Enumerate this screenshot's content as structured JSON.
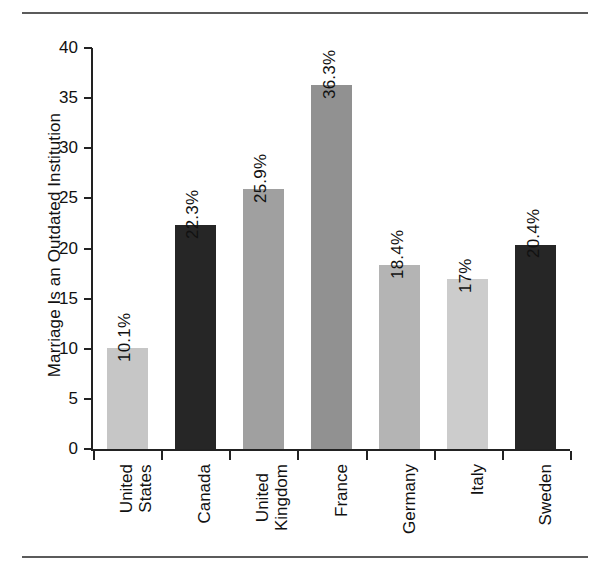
{
  "figure": {
    "y_axis_title": "Marriage Is an Outdated Institution",
    "rules": {
      "top": "horizontal-rule",
      "bottom": "horizontal-rule"
    }
  },
  "chart_data": {
    "type": "bar",
    "title": "",
    "xlabel": "",
    "ylabel": "Marriage Is an Outdated Institution",
    "ylim": [
      0,
      40
    ],
    "yticks": [
      0,
      5,
      10,
      15,
      20,
      25,
      30,
      35,
      40
    ],
    "ytick_labels": [
      "0",
      "5",
      "10",
      "15",
      "20",
      "25",
      "30",
      "35",
      "40"
    ],
    "grid": false,
    "legend": "none",
    "categories": [
      "United States",
      "Canada",
      "United Kingdom",
      "France",
      "Germany",
      "Italy",
      "Sweden"
    ],
    "category_lines": [
      [
        "United",
        "States"
      ],
      [
        "Canada"
      ],
      [
        "United",
        "Kingdom"
      ],
      [
        "France"
      ],
      [
        "Germany"
      ],
      [
        "Italy"
      ],
      [
        "Sweden"
      ]
    ],
    "values": [
      10.1,
      22.3,
      25.9,
      36.3,
      18.4,
      17,
      20.4
    ],
    "data_labels": [
      "10.1%",
      "22.3%",
      "25.9%",
      "36.3%",
      "18.4%",
      "17%",
      "20.4%"
    ],
    "bar_colors": [
      "#c6c6c6",
      "#262626",
      "#a0a0a0",
      "#919191",
      "#b4b4b4",
      "#cccccc",
      "#262626"
    ]
  },
  "colors": {
    "axis": "#222222",
    "rule": "#5b5b5b",
    "text": "#111111",
    "background": "#ffffff"
  }
}
